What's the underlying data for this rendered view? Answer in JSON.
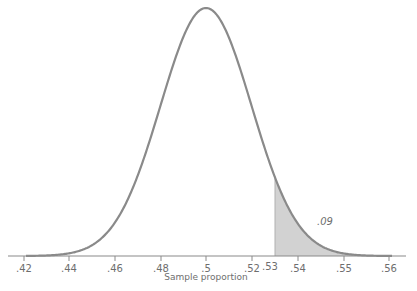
{
  "chart_data": {
    "type": "area",
    "title": "",
    "xlabel": "Sample proportion",
    "ylabel": "",
    "distribution": "normal",
    "mean": 0.5,
    "x_ticks": [
      {
        "label": ".42",
        "px": 24
      },
      {
        "label": ".44",
        "px": 69
      },
      {
        "label": ".46",
        "px": 115
      },
      {
        "label": ".48",
        "px": 161
      },
      {
        "label": ".5",
        "px": 206
      },
      {
        "label": ".52",
        "px": 252
      },
      {
        "label": ".53",
        "px": 275,
        "marker": "shade-boundary"
      },
      {
        "label": ".54",
        "px": 298
      },
      {
        "label": ".55",
        "px": 344
      },
      {
        "label": ".56",
        "px": 389
      }
    ],
    "shaded_region": {
      "from": 0.53,
      "to": "right tail",
      "area_label": ".09"
    },
    "grid": false,
    "legend": null,
    "colors": {
      "curve": "#8a8a8a",
      "shade": "#d2d2d2",
      "axis": "#8a8a8a",
      "text": "#6e6e6e"
    }
  },
  "layout": {
    "axis_y": 256,
    "axis_x0": 8,
    "axis_x1": 406,
    "peak_x": 206,
    "peak_y": 8,
    "sigma_px": 45.5,
    "shade_x": 275
  }
}
